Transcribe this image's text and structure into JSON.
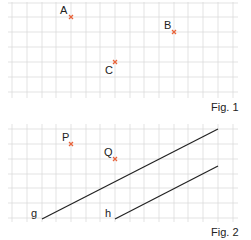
{
  "figures": [
    {
      "caption": "Fig. 1",
      "points": [
        {
          "label": "A",
          "gx": 4,
          "gy": 1
        },
        {
          "label": "B",
          "gx": 11,
          "gy": 2
        },
        {
          "label": "C",
          "gx": 7,
          "gy": 4
        }
      ]
    },
    {
      "caption": "Fig. 2",
      "points": [
        {
          "label": "P",
          "gx": 4,
          "gy": 1
        },
        {
          "label": "Q",
          "gx": 7,
          "gy": 2
        }
      ],
      "lines": [
        {
          "label": "g"
        },
        {
          "label": "h"
        }
      ]
    }
  ],
  "colors": {
    "grid": "#dcdcdc",
    "point": "#e8643c",
    "line": "#222222"
  }
}
